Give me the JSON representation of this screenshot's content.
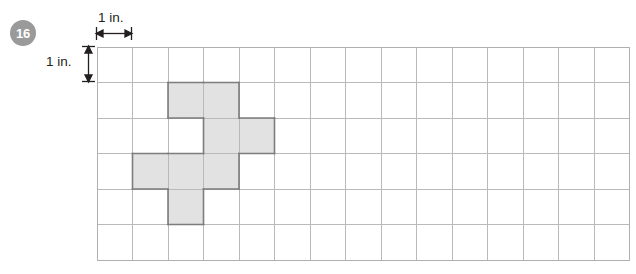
{
  "problem": {
    "number": "16",
    "badge_color": "#9a9a9a",
    "badge_text_color": "#ffffff"
  },
  "labels": {
    "horizontal_measure": "1 in.",
    "vertical_measure": "1 in."
  },
  "figure": {
    "type": "square-grid-shaded-shape",
    "grid": {
      "columns": 15,
      "rows": 6,
      "cell_size_px": 35.5,
      "origin_x_px": 96,
      "origin_y_px": 46,
      "line_color": "#b9b9b9",
      "border_color": "#b0b0b0"
    },
    "unit": "in.",
    "shaded": {
      "fill_color": "#e2e2e2",
      "outline_color": "#7d7d7d",
      "count": 8,
      "cells": [
        {
          "col": 2,
          "row": 1
        },
        {
          "col": 3,
          "row": 1
        },
        {
          "col": 3,
          "row": 2
        },
        {
          "col": 4,
          "row": 2
        },
        {
          "col": 1,
          "row": 3
        },
        {
          "col": 2,
          "row": 3
        },
        {
          "col": 3,
          "row": 3
        },
        {
          "col": 2,
          "row": 4
        }
      ]
    },
    "measurements": [
      {
        "name": "width-measure",
        "label": "1 in.",
        "orientation": "horizontal",
        "spans_cells": 1
      },
      {
        "name": "height-measure",
        "label": "1 in.",
        "orientation": "vertical",
        "spans_cells": 1
      }
    ]
  }
}
